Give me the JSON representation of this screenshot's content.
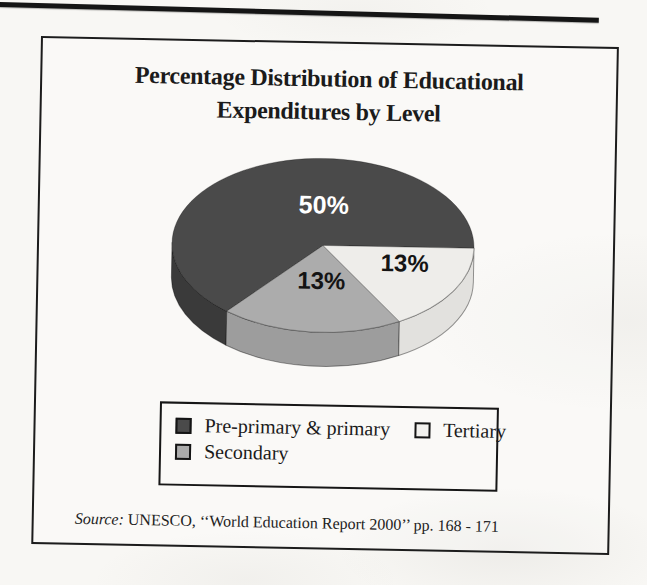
{
  "document": {
    "paper_color": "#f8f7f4",
    "top_rule_color": "#151515"
  },
  "chart": {
    "title_line1": "Percentage Distribution of Educational",
    "title_line2": "Expenditures by Level",
    "source": {
      "prefix": "Source:",
      "text": " UNESCO, ‘‘World Education Report 2000’’ pp. 168 - 171"
    }
  },
  "legend": {
    "position": "bottom-inside-frame",
    "items": [
      {
        "label": "Pre-primary & primary",
        "swatch": "#4a4a4a"
      },
      {
        "label": "Tertiary",
        "swatch": "#f2f1ee"
      },
      {
        "label": "Secondary",
        "swatch": "#ababab"
      }
    ]
  },
  "chart_data": {
    "type": "pie",
    "style": "3d",
    "title": "Percentage Distribution of Educational Expenditures by Level",
    "labels": [
      "Pre-primary & primary",
      "Secondary",
      "Tertiary"
    ],
    "values": [
      50,
      13,
      13
    ],
    "value_labels": [
      "50%",
      "13%",
      "13%"
    ],
    "legend_position": "bottom",
    "source": "UNESCO, ‘‘World Education Report 2000’’ pp. 168 - 171",
    "geometry": {
      "cx": 185,
      "cy": 114,
      "rx": 151,
      "ry": 87,
      "depth": 34
    },
    "segments": [
      {
        "name": "Pre-primary & primary",
        "value": 50,
        "value_label": "50%",
        "start_deg": 0,
        "end_deg": 231,
        "top_color": "#4a4a4a",
        "side_color": "#3a3a3a",
        "label_color": "#ffffff",
        "label_size": 25,
        "label_x": 185,
        "label_y": 73
      },
      {
        "name": "Secondary",
        "value": 13,
        "value_label": "13%",
        "start_deg": 231,
        "end_deg": 301,
        "top_color": "#acacac",
        "side_color": "#9d9d9d",
        "label_color": "#141414",
        "label_size": 24,
        "label_x": 184,
        "label_y": 149
      },
      {
        "name": "Tertiary",
        "value": 13,
        "value_label": "13%",
        "start_deg": 301,
        "end_deg": 360,
        "top_color": "#eeedea",
        "side_color": "#e2e1de",
        "label_color": "#141414",
        "label_size": 24,
        "label_x": 267,
        "label_y": 130
      }
    ]
  }
}
